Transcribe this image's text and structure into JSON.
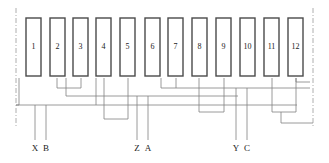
{
  "diagram": {
    "canvas": {
      "width": 329,
      "height": 163
    },
    "style": {
      "coil_stroke": "#4a4a4a",
      "coil_fill": "#ffffff",
      "wire_color": "#808080",
      "boundary_color": "#999999",
      "text_color": "#1a1a1a",
      "coil_stroke_width": 1.4,
      "wire_stroke_width": 0.8
    },
    "coils": [
      {
        "label": "1",
        "x": 26,
        "y": 18,
        "w": 15,
        "h": 58
      },
      {
        "label": "2",
        "x": 50,
        "y": 18,
        "w": 15,
        "h": 58
      },
      {
        "label": "3",
        "x": 73,
        "y": 18,
        "w": 15,
        "h": 58
      },
      {
        "label": "4",
        "x": 96,
        "y": 18,
        "w": 15,
        "h": 58
      },
      {
        "label": "5",
        "x": 120,
        "y": 18,
        "w": 15,
        "h": 58
      },
      {
        "label": "6",
        "x": 145,
        "y": 18,
        "w": 15,
        "h": 58
      },
      {
        "label": "7",
        "x": 168,
        "y": 18,
        "w": 15,
        "h": 58
      },
      {
        "label": "8",
        "x": 192,
        "y": 18,
        "w": 15,
        "h": 58
      },
      {
        "label": "9",
        "x": 216,
        "y": 18,
        "w": 15,
        "h": 58
      },
      {
        "label": "10",
        "x": 240,
        "y": 18,
        "w": 15,
        "h": 58
      },
      {
        "label": "11",
        "x": 264,
        "y": 18,
        "w": 15,
        "h": 58
      },
      {
        "label": "12",
        "x": 288,
        "y": 18,
        "w": 15,
        "h": 58
      }
    ],
    "boundaries": [
      {
        "name": "left-boundary",
        "x": 16,
        "y1": 8,
        "y2": 128
      },
      {
        "name": "right-boundary",
        "x": 313,
        "y1": 8,
        "y2": 128
      }
    ],
    "terminals": [
      {
        "label": "X",
        "x": 35,
        "lead_top": 105,
        "lead_bottom": 140,
        "label_y": 151
      },
      {
        "label": "B",
        "x": 46,
        "lead_top": 105,
        "lead_bottom": 140,
        "label_y": 151
      },
      {
        "label": "Z",
        "x": 137,
        "lead_top": 96,
        "lead_bottom": 140,
        "label_y": 151
      },
      {
        "label": "A",
        "x": 148,
        "lead_top": 96,
        "lead_bottom": 140,
        "label_y": 151
      },
      {
        "label": "Y",
        "x": 236,
        "lead_top": 88,
        "lead_bottom": 140,
        "label_y": 151
      },
      {
        "label": "C",
        "x": 247,
        "lead_top": 88,
        "lead_bottom": 140,
        "label_y": 151
      }
    ],
    "wires": [
      {
        "name": "wire-coil1-down",
        "points": "19,78 19,105 16,105"
      },
      {
        "name": "wire-bus-x-left",
        "points": "16,105 297,105"
      },
      {
        "name": "wire-coil2-coil3",
        "points": "57,78 57,88 81,88 81,78"
      },
      {
        "name": "wire-coil3-bus",
        "points": "66,78 66,96 238,96"
      },
      {
        "name": "wire-coil4-loop",
        "points": "104,78 104,119 128,119 128,78"
      },
      {
        "name": "wire-coil4-up",
        "points": "96,78 96,105"
      },
      {
        "name": "wire-coil7-bus",
        "points": "161,78 161,88 176,88 176,78"
      },
      {
        "name": "wire-coil7-right",
        "points": "176,88 310,88"
      },
      {
        "name": "wire-coil8-loop",
        "points": "199,78 199,112 224,112 224,78"
      },
      {
        "name": "wire-coil11-loop",
        "points": "272,78 272,112 296,112 296,78"
      },
      {
        "name": "wire-coil12-bus",
        "points": "296,78 296,82 310,82"
      },
      {
        "name": "wire-bottom-right",
        "points": "281,123 313,123"
      },
      {
        "name": "wire-bottom-right-stub",
        "points": "281,112 281,123"
      }
    ]
  }
}
